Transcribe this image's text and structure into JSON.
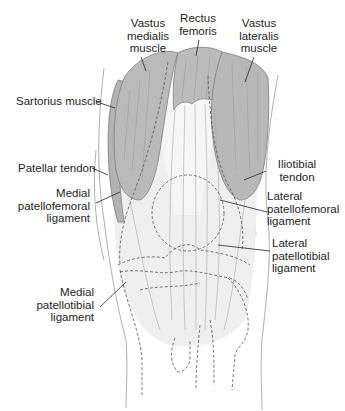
{
  "diagram": {
    "type": "anatomical-illustration",
    "colors": {
      "muscle": "#b9b9b9",
      "muscle_dark": "#a4a4a4",
      "tendon": "#e4e4e4",
      "tissue_light": "#efefef",
      "outline": "#7a7a7a",
      "leader_line": "#222222",
      "text": "#1e1e1e"
    }
  },
  "labels": {
    "vastus_medialis": "Vastus\nmedialis\nmuscle",
    "rectus_femoris": "Rectus\nfemoris",
    "vastus_lateralis": "Vastus\nlateralis\nmuscle",
    "sartorius": "Sartorius muscle",
    "patellar_tendon": "Patellar tendon",
    "iliotibial_tendon": "Iliotibial\ntendon",
    "medial_patellofemoral": "Medial\npatellofemoral\nligament",
    "lateral_patellofemoral": "Lateral\npatellofemoral\nligament",
    "medial_patellotibial": "Medial\npatellotibial\nligament",
    "lateral_patellotibial": "Lateral\npatellotibial\nligament"
  }
}
